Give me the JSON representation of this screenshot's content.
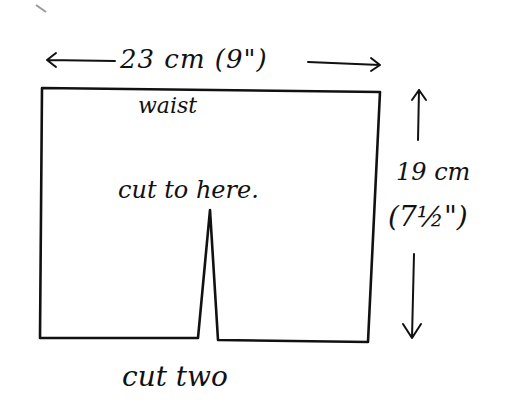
{
  "diagram": {
    "kind": "sewing-pattern-piece",
    "stroke_color": "#111111",
    "background": "#ffffff",
    "labels": {
      "width": "23 cm (9\")",
      "waist": "waist",
      "cut_to_here": "cut to here.",
      "height_cm": "19 cm",
      "height_in": "(7½\")",
      "cut_two": "cut two"
    },
    "dimensions": {
      "width": {
        "metric": "23 cm",
        "imperial": "9\""
      },
      "height": {
        "metric": "19 cm",
        "imperial": "7½\""
      }
    },
    "shape": {
      "outline": [
        [
          42,
          88
        ],
        [
          380,
          92
        ],
        [
          368,
          342
        ],
        [
          218,
          340
        ],
        [
          210,
          210
        ],
        [
          198,
          338
        ],
        [
          40,
          338
        ]
      ],
      "slit_apex": [
        210,
        210
      ]
    }
  }
}
